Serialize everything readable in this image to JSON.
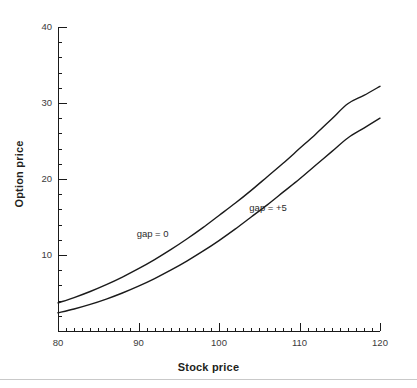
{
  "chart_data": {
    "type": "line",
    "title": "",
    "subtitle": "",
    "xlabel": "Stock price",
    "ylabel": "Option price",
    "xlim": [
      80,
      120
    ],
    "ylim": [
      0,
      40
    ],
    "grid": false,
    "legend_position": "inline-annotations",
    "x_ticks": [
      80,
      90,
      100,
      110,
      120
    ],
    "x_tick_labels": [
      "80",
      "90",
      "100",
      "110",
      "120"
    ],
    "x_minor_tick_step": 1,
    "y_ticks": [
      10,
      20,
      30,
      40
    ],
    "y_tick_labels": [
      "10",
      "20",
      "30",
      "40"
    ],
    "y_minor_tick_step": 2,
    "line_color": "#1a1a1a",
    "x": [
      80,
      82,
      84,
      86,
      88,
      90,
      92,
      94,
      96,
      98,
      100,
      102,
      104,
      106,
      108,
      110,
      112,
      114,
      116,
      118,
      120
    ],
    "series": [
      {
        "name": "gap = 0",
        "label": "gap = 0",
        "label_x": 92.5,
        "label_y": 12.6,
        "values": [
          3.7,
          4.4,
          5.2,
          6.1,
          7.1,
          8.2,
          9.4,
          10.7,
          12.1,
          13.6,
          15.2,
          16.8,
          18.5,
          20.3,
          22.1,
          24.0,
          25.9,
          27.9,
          29.9,
          31.0,
          32.2
        ]
      },
      {
        "name": "gap = +5",
        "label": "gap = +5",
        "label_x": 106.5,
        "label_y": 16.1,
        "values": [
          2.4,
          2.9,
          3.5,
          4.2,
          5.0,
          5.9,
          6.9,
          8.0,
          9.2,
          10.5,
          11.9,
          13.4,
          15.0,
          16.6,
          18.3,
          20.0,
          21.8,
          23.6,
          25.4,
          26.7,
          28.0
        ]
      }
    ],
    "annotations": [
      {
        "text": "gap = 0",
        "x": 92.5,
        "y": 12.6
      },
      {
        "text": "gap = +5",
        "x": 106.5,
        "y": 16.1
      }
    ]
  }
}
